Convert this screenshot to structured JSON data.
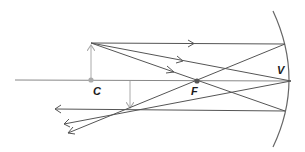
{
  "diagram": {
    "type": "concave-mirror-ray-diagram",
    "labels": {
      "center_of_curvature": "C",
      "focal_point": "F",
      "vertex": "V"
    },
    "colors": {
      "rays": "#555555",
      "object_arrow": "#aaaaaa",
      "axis": "#888888",
      "mirror": "#666666",
      "point_c": "#aaaaaa",
      "point_f": "#555555"
    }
  }
}
